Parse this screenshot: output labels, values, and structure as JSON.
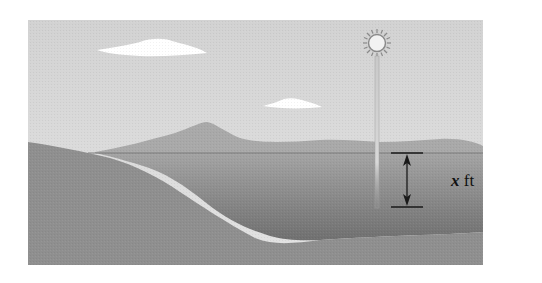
{
  "figure": {
    "depth_label": {
      "variable": "x",
      "unit": " ft"
    },
    "elements": [
      "sky",
      "clouds",
      "sun",
      "pole",
      "mountains",
      "lake",
      "shore",
      "depth-arrow"
    ],
    "colors": {
      "sky": "#d9d9d9",
      "cloud": "#ffffff",
      "mountain": "#a8a8a8",
      "water_top": "#9c9c9c",
      "water_bottom": "#6e6e6e",
      "shore": "#8e8e8e",
      "ink": "#1a1a1a"
    }
  }
}
